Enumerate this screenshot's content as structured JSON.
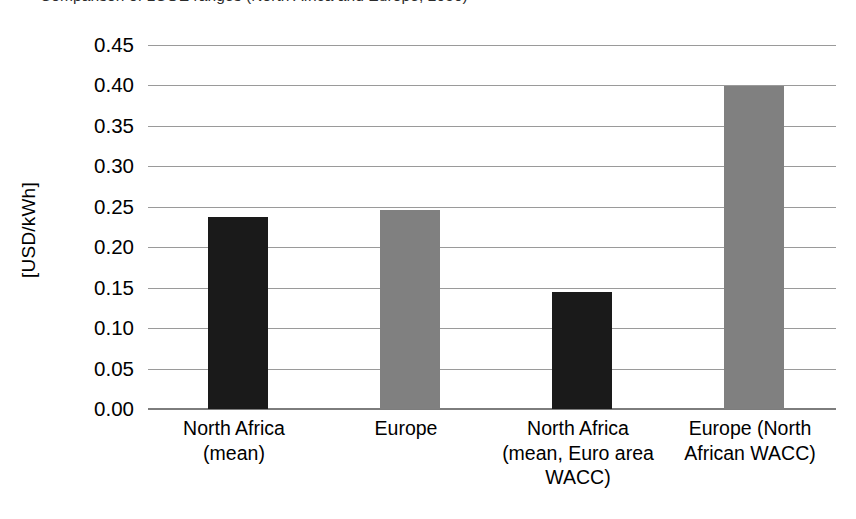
{
  "chart_data": {
    "type": "bar",
    "title": "",
    "xlabel": "",
    "ylabel": "[USD/kWh]",
    "ylim": [
      0.0,
      0.45
    ],
    "ytick_step": 0.05,
    "grid": true,
    "legend": "none",
    "categories": [
      "North Africa (mean)",
      "Europe",
      "North Africa (mean, Euro area WACC)",
      "Europe (North African WACC)"
    ],
    "values": [
      0.237,
      0.246,
      0.145,
      0.399
    ],
    "bar_colors": [
      "#1a1a1a",
      "#808080",
      "#1a1a1a",
      "#808080"
    ],
    "ytick_labels": [
      "0.45",
      "0.40",
      "0.35",
      "0.30",
      "0.25",
      "0.20",
      "0.15",
      "0.10",
      "0.05",
      "0.00"
    ],
    "ytick_values": [
      0.45,
      0.4,
      0.35,
      0.3,
      0.25,
      0.2,
      0.15,
      0.1,
      0.05,
      0.0
    ]
  },
  "axis": {
    "y_title": "[USD/kWh]"
  },
  "category_label_lines": [
    [
      "North Africa",
      "(mean)"
    ],
    [
      "Europe"
    ],
    [
      "North Africa",
      "(mean, Euro area",
      "WACC)"
    ],
    [
      "Europe (North",
      "African WACC)"
    ]
  ],
  "title_strip": {
    "text": "Comparison of LCOE ranges (North Africa and Europe, 2050)"
  },
  "colors": {
    "bar_dark": "#1a1a1a",
    "bar_light": "#808080",
    "gridline": "#9a9a9a",
    "axis_line": "#7d7d7d",
    "text": "#000000",
    "background": "#ffffff"
  }
}
